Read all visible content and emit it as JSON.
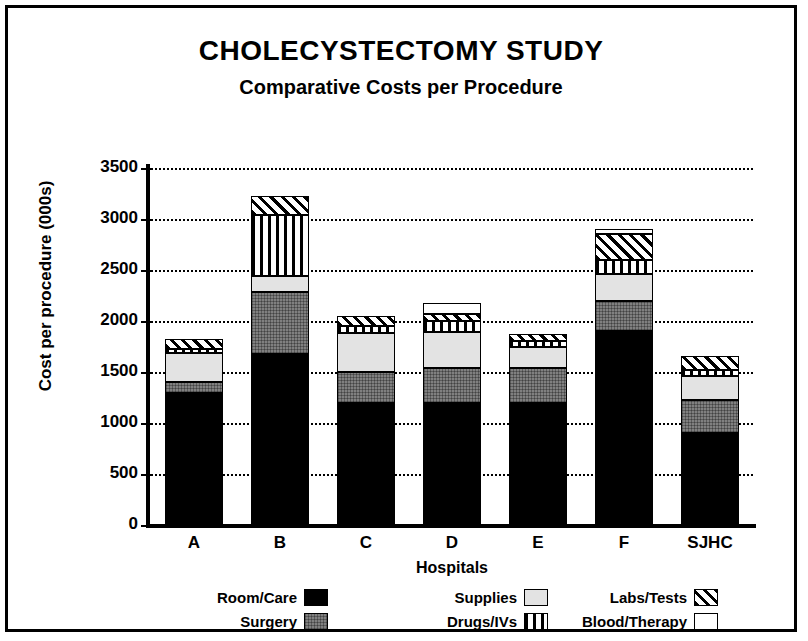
{
  "chart_data": {
    "type": "bar",
    "stacked": true,
    "title": "CHOLECYSTECTOMY STUDY",
    "subtitle": "Comparative Costs per Procedure",
    "xlabel": "Hospitals",
    "ylabel": "Cost per procedure (000s)",
    "ylim": [
      0,
      3500
    ],
    "yticks": [
      0,
      500,
      1000,
      1500,
      2000,
      2500,
      3000,
      3500
    ],
    "ytick_labels": [
      "0",
      "500",
      "1000",
      "1500",
      "2000",
      "2500",
      "3000",
      "3500"
    ],
    "grid": "horizontal-dotted",
    "legend_position": "bottom",
    "categories": [
      "A",
      "B",
      "C",
      "D",
      "E",
      "F",
      "SJHC"
    ],
    "series": [
      {
        "name": "Room/Care",
        "fill": "solid-black",
        "color": "#000000",
        "values": [
          1290,
          1680,
          1200,
          1200,
          1200,
          1900,
          900
        ]
      },
      {
        "name": "Surgery",
        "fill": "solid-gray",
        "color": "#808080",
        "values": [
          110,
          600,
          300,
          340,
          340,
          300,
          330
        ]
      },
      {
        "name": "Supplies",
        "fill": "light-gray",
        "color": "#e3e3e3",
        "values": [
          290,
          160,
          380,
          350,
          210,
          260,
          230
        ]
      },
      {
        "name": "Drugs/IVs",
        "fill": "vertical-stripes",
        "color": "#ffffff",
        "values": [
          40,
          600,
          70,
          110,
          50,
          140,
          60
        ]
      },
      {
        "name": "Labs/Tests",
        "fill": "diagonal-hatch",
        "color": "#ffffff",
        "values": [
          90,
          190,
          100,
          70,
          70,
          250,
          140
        ]
      },
      {
        "name": "Blood/Therapy",
        "fill": "white",
        "color": "#ffffff",
        "values": [
          0,
          0,
          0,
          110,
          0,
          50,
          0
        ]
      }
    ],
    "totals": [
      1820,
      3230,
      2050,
      2180,
      1870,
      2900,
      1660
    ]
  },
  "legend": {
    "items": [
      {
        "label": "Room/Care",
        "swatch": "solid-black"
      },
      {
        "label": "Surgery",
        "swatch": "solid-gray"
      },
      {
        "label": "Supplies",
        "swatch": "light-gray"
      },
      {
        "label": "Drugs/IVs",
        "swatch": "vertical-stripes"
      },
      {
        "label": "Labs/Tests",
        "swatch": "diagonal-hatch"
      },
      {
        "label": "Blood/Therapy",
        "swatch": "white"
      }
    ]
  },
  "colors": {
    "frame": "#000000",
    "background": "#ffffff",
    "axis": "#000000"
  }
}
